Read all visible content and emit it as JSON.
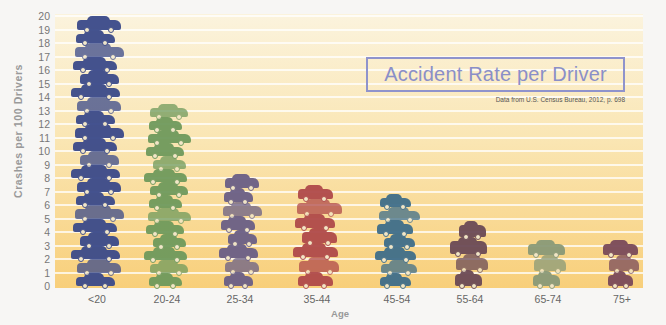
{
  "chart_data": {
    "type": "bar",
    "title": "Accident Rate per Driver",
    "source": "Data from U.S. Census Bureau, 2012, p. 698",
    "xlabel": "Age",
    "ylabel": "Crashes per 100 Drivers",
    "categories": [
      "<20",
      "20-24",
      "25-34",
      "35-44",
      "45-54",
      "55-64",
      "65-74",
      "75+"
    ],
    "values": [
      20,
      13.5,
      8.3,
      7.5,
      6.8,
      4.8,
      3.4,
      3.4
    ],
    "car_counts": [
      20,
      14,
      8,
      7,
      7,
      4,
      3,
      3
    ],
    "colors": [
      "#3b4a8a",
      "#6f9a5c",
      "#6a5f86",
      "#b04a4a",
      "#3f6e8a",
      "#6b4a56",
      "#8a9a78",
      "#7a4a5a"
    ],
    "ylim": [
      0,
      20
    ],
    "yticks": [
      0,
      1,
      2,
      3,
      4,
      5,
      6,
      7,
      8,
      9,
      10,
      11,
      12,
      13,
      14,
      15,
      16,
      17,
      18,
      19,
      20
    ],
    "grid": true,
    "legend": "none",
    "style": "pictograph (stacked car icons)"
  },
  "labels": {
    "title": "Accident Rate per Driver",
    "source": "Data from U.S. Census Bureau, 2012, p. 698",
    "xlabel": "Age",
    "ylabel": "Crashes per 100 Drivers"
  }
}
